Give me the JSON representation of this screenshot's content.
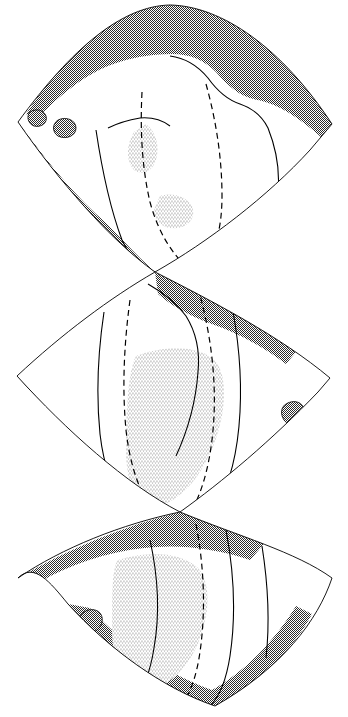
{
  "figure": {
    "title": "Interrupted three-lobe (butterfly) world map",
    "background_color": "#ffffff",
    "ink_color": "#000000",
    "ocean_fill_color": "#9a9a9a",
    "shelf_fill_color": "#d8d8d8",
    "land_fill_color": "#ffffff",
    "width_px": 348,
    "height_px": 717
  },
  "legend": {
    "ocean_label": "deep ocean (dark stipple)",
    "shelf_label": "shallow / epicontinental sea (light stipple)",
    "land_label": "continental land (white)",
    "coastline_label": "coastline (solid line)",
    "inferred_label": "inferred boundary (dashed line)"
  },
  "lobes": [
    {
      "name": "northern-lobe",
      "index": 1,
      "apex_point": "170,5",
      "left_corner": "18,122",
      "right_corner": "332,124",
      "bottom_point": "155,272"
    },
    {
      "name": "central-lobe",
      "index": 2,
      "apex_point": "155,272",
      "left_corner": "17,376",
      "right_corner": "330,378",
      "bottom_point": "180,512"
    },
    {
      "name": "southern-lobe",
      "index": 3,
      "apex_point": "180,512",
      "left_corner": "18,578",
      "right_corner": "332,578",
      "bottom_point": "215,706"
    }
  ],
  "map_geometry": {
    "lobe1": {
      "outline": "M170,5 C222,6 282,48 332,124 L310,150 C268,196 208,242 155,272 C110,240 58,180 18,122 C72,48 122,6 170,5 Z",
      "ocean_regions": [
        "M170,5 C222,6 282,48 332,124 L322,138 C300,118 278,104 258,100 C240,97 228,86 216,72 C204,60 190,54 172,54 C150,54 128,58 108,66 C88,74 66,90 48,108 C40,116 32,118 26,114 C68,48 122,6 170,5 Z",
        "M18,122 C40,152 66,186 96,214 C110,226 126,244 140,258 L155,272 C128,256 96,230 68,200 C48,178 32,150 18,122 Z"
      ],
      "coastlines": [
        "M96,130 C102,170 110,208 122,240 C130,258 142,268 155,272",
        "M170,56 C186,58 198,66 208,78 C218,92 228,100 240,104 C252,108 262,116 268,128 C276,148 280,170 278,192 C276,214 268,232 254,246 C240,260 222,268 204,272",
        "M108,128 C116,124 128,120 140,118 C152,117 162,120 170,126"
      ],
      "dashed_lines": [
        "M142,92 C140,130 142,168 150,202 C158,232 172,254 188,268",
        "M206,84 C216,120 222,158 222,196 C222,226 216,250 204,266"
      ],
      "shelf_patches": [
        "M146,124 C156,132 160,146 156,160 C152,172 142,176 134,170 C126,162 126,144 134,132 Z",
        "M160,196 C172,192 186,196 192,206 C196,216 190,226 178,228 C164,230 154,222 154,210 Z"
      ],
      "islands": [
        "M30,112 C36,108 44,110 46,116 C48,122 42,128 34,126 C28,124 26,116 30,112 Z",
        "M58,120 C66,116 76,120 76,128 C76,136 66,140 58,136 C52,132 52,124 58,120 Z"
      ]
    },
    "lobe2": {
      "outline": "M155,272 C210,300 280,336 330,378 L318,392 C272,440 222,482 180,512 C126,484 66,430 17,376 C62,334 110,298 155,272 Z",
      "ocean_regions": [
        "M155,272 C196,290 250,318 296,352 L286,364 C262,346 236,332 212,324 C190,316 172,306 158,294 Z",
        "M17,376 C52,414 96,458 140,492 L180,512 C140,496 92,460 52,420 C38,406 26,392 17,376 Z"
      ],
      "coastlines": [
        "M104,312 C98,352 96,394 100,434 C104,468 114,494 128,512",
        "M230,296 C238,334 242,374 240,412 C238,450 230,484 216,508",
        "M148,284 C162,292 176,302 186,316 C196,332 200,352 198,372 C196,400 188,430 176,456"
      ],
      "dashed_lines": [
        "M130,300 C124,344 122,388 126,430 C130,466 140,494 154,512",
        "M198,288 C210,330 216,374 214,416 C212,456 204,488 192,510"
      ],
      "shelf_patches": [
        "M136,356 C168,344 202,346 216,362 C228,378 226,412 214,444 C200,480 178,502 158,506 C138,508 126,486 126,450 C126,410 128,372 136,356 Z"
      ],
      "islands": [
        "M286,404 C296,398 306,404 304,414 C302,424 290,428 284,420 C280,414 281,407 286,404 Z"
      ]
    },
    "lobe3": {
      "outline": "M180,512 C238,536 296,552 332,578 C318,620 282,668 215,706 C162,688 108,648 68,604 C50,582 34,562 18,578 C62,548 122,524 180,512 Z",
      "ocean_regions": [
        "M18,578 C70,548 124,526 180,512 C206,522 236,532 264,544 L250,560 C214,548 178,544 144,548 C108,552 70,564 40,582 Z",
        "M68,604 C108,652 160,688 215,706 C260,684 294,648 312,614 L296,606 C274,642 244,672 212,690 C172,676 124,646 90,608 Z"
      ],
      "coastlines": [
        "M226,530 C234,572 236,616 230,656 C226,682 218,698 210,706",
        "M150,540 C158,576 160,614 154,648 C150,674 142,692 132,704",
        "M262,546 C268,584 270,622 266,658"
      ],
      "dashed_lines": [
        "M196,524 C204,566 206,610 200,652 C196,680 188,698 180,706"
      ],
      "shelf_patches": [
        "M118,560 C148,550 182,552 198,568 C212,584 210,618 196,648 C182,676 160,692 142,690 C122,688 112,664 112,628 C112,594 112,568 118,560 Z"
      ],
      "islands": [
        "M84,612 C94,606 104,612 102,622 C100,632 88,636 82,628 C78,622 79,615 84,612 Z",
        "M96,646 C106,640 118,646 116,656 C114,666 102,670 96,662 C92,656 92,649 96,646 Z"
      ]
    }
  }
}
